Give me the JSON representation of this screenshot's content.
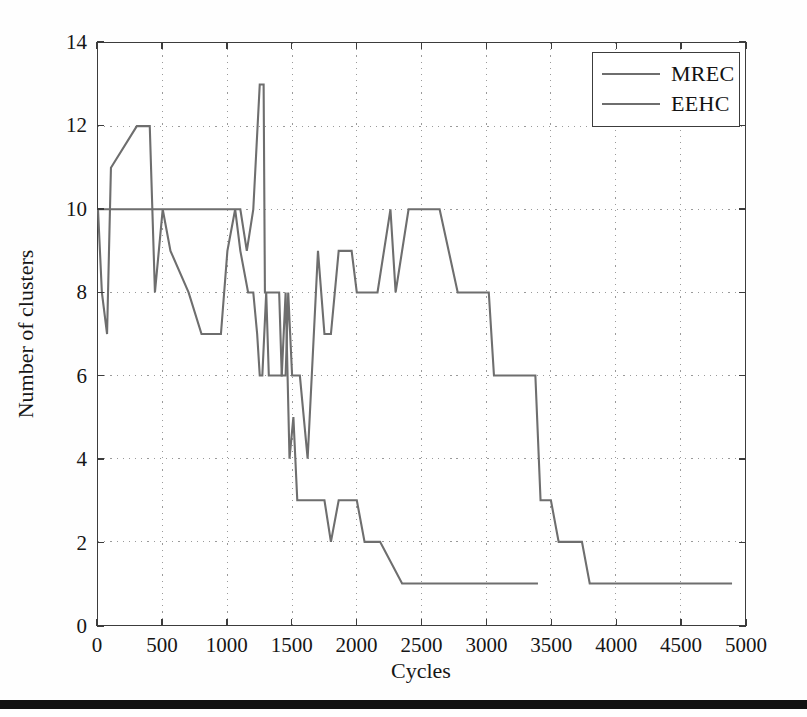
{
  "chart_data": {
    "type": "line",
    "title": "",
    "xlabel": "Cycles",
    "ylabel": "Number of clusters",
    "xlim": [
      0,
      5000
    ],
    "ylim": [
      0,
      14
    ],
    "xticks": [
      0,
      500,
      1000,
      1500,
      2000,
      2500,
      3000,
      3500,
      4000,
      4500,
      5000
    ],
    "yticks": [
      0,
      2,
      4,
      6,
      8,
      10,
      12,
      14
    ],
    "xtick_labels": [
      "0",
      "500",
      "1000",
      "1500",
      "2000",
      "2500",
      "3000",
      "3500",
      "4000",
      "4500",
      "5000"
    ],
    "ytick_labels": [
      "0",
      "2",
      "4",
      "6",
      "8",
      "10",
      "12",
      "14"
    ],
    "grid": true,
    "grid_style": "dotted",
    "legend_position": "top-right",
    "legend": [
      "MREC",
      "EEHC"
    ],
    "line_color": "#6e6e6e",
    "series": [
      {
        "name": "MREC",
        "color": "#6e6e6e",
        "points": [
          [
            0,
            10
          ],
          [
            30,
            8
          ],
          [
            70,
            7
          ],
          [
            100,
            11
          ],
          [
            300,
            12
          ],
          [
            400,
            12
          ],
          [
            440,
            8
          ],
          [
            500,
            10
          ],
          [
            560,
            9
          ],
          [
            700,
            8
          ],
          [
            800,
            7
          ],
          [
            950,
            7
          ],
          [
            1000,
            9
          ],
          [
            1060,
            10
          ],
          [
            1100,
            9
          ],
          [
            1160,
            8
          ],
          [
            1200,
            8
          ],
          [
            1230,
            7
          ],
          [
            1250,
            6
          ],
          [
            1270,
            6
          ],
          [
            1300,
            8
          ],
          [
            1320,
            6
          ],
          [
            1360,
            6
          ],
          [
            1420,
            6
          ],
          [
            1450,
            8
          ],
          [
            1480,
            4
          ],
          [
            1510,
            5
          ],
          [
            1540,
            3
          ],
          [
            1560,
            3
          ],
          [
            1750,
            3
          ],
          [
            1800,
            2
          ],
          [
            1860,
            3
          ],
          [
            1960,
            3
          ],
          [
            2000,
            3
          ],
          [
            2060,
            2
          ],
          [
            2180,
            2
          ],
          [
            2350,
            1
          ],
          [
            2600,
            1
          ],
          [
            3000,
            1
          ],
          [
            3400,
            1
          ]
        ]
      },
      {
        "name": "EEHC",
        "color": "#6e6e6e",
        "points": [
          [
            0,
            10
          ],
          [
            500,
            10
          ],
          [
            1000,
            10
          ],
          [
            1060,
            10
          ],
          [
            1100,
            10
          ],
          [
            1150,
            9
          ],
          [
            1200,
            10
          ],
          [
            1250,
            13
          ],
          [
            1280,
            13
          ],
          [
            1290,
            8
          ],
          [
            1350,
            8
          ],
          [
            1400,
            8
          ],
          [
            1420,
            6
          ],
          [
            1450,
            6
          ],
          [
            1470,
            8
          ],
          [
            1500,
            6
          ],
          [
            1560,
            6
          ],
          [
            1620,
            4
          ],
          [
            1700,
            9
          ],
          [
            1750,
            7
          ],
          [
            1800,
            7
          ],
          [
            1860,
            9
          ],
          [
            1960,
            9
          ],
          [
            2000,
            8
          ],
          [
            2160,
            8
          ],
          [
            2260,
            10
          ],
          [
            2300,
            8
          ],
          [
            2400,
            10
          ],
          [
            2560,
            10
          ],
          [
            2640,
            10
          ],
          [
            2780,
            8
          ],
          [
            3020,
            8
          ],
          [
            3060,
            6
          ],
          [
            3200,
            6
          ],
          [
            3380,
            6
          ],
          [
            3420,
            3
          ],
          [
            3500,
            3
          ],
          [
            3560,
            2
          ],
          [
            3740,
            2
          ],
          [
            3800,
            1
          ],
          [
            4200,
            1
          ],
          [
            4600,
            1
          ],
          [
            4900,
            1
          ]
        ]
      }
    ]
  },
  "figure": {
    "background_color": "#ffffff",
    "axis_color": "#3c3c3c",
    "grid_color": "#9a9a9a",
    "text_color": "#161616",
    "scan_bar_color": "#121212"
  }
}
